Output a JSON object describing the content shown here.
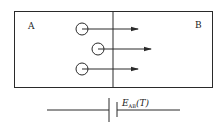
{
  "diagram": {
    "region_a_label": "A",
    "region_b_label": "B",
    "particles": [
      {
        "name": "charge-carrier-1"
      },
      {
        "name": "charge-carrier-2"
      },
      {
        "name": "charge-carrier-3"
      }
    ],
    "emf_label": {
      "symbol": "E",
      "subscript": "AB",
      "argument": "(T)"
    },
    "colors": {
      "stroke": "#2a2a2a",
      "background": "#ffffff"
    }
  }
}
